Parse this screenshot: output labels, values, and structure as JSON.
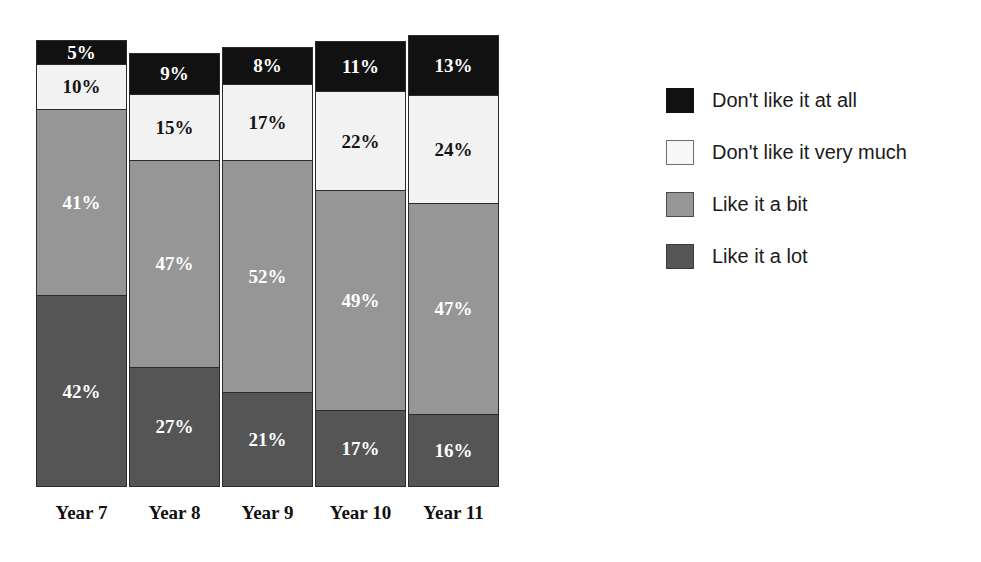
{
  "chart_data": {
    "type": "bar",
    "subtype": "100% stacked column",
    "title": "",
    "subtitle": "",
    "xlabel": "",
    "ylabel": "",
    "ylim": [
      0,
      100
    ],
    "grid": false,
    "legend_position": "right",
    "value_suffix": "%",
    "categories": [
      "Year 7",
      "Year 8",
      "Year 9",
      "Year 10",
      "Year 11"
    ],
    "series": [
      {
        "name": "Don't like it at all",
        "color": "#111111",
        "label_color": "#ffffff",
        "values": [
          5,
          9,
          8,
          11,
          13
        ],
        "labels": [
          "5%",
          "9%",
          "8%",
          "11%",
          "13%"
        ]
      },
      {
        "name": "Don't like it very much",
        "color": "#f2f2f2",
        "label_color": "#141414",
        "values": [
          10,
          15,
          17,
          22,
          24
        ],
        "labels": [
          "10%",
          "15%",
          "17%",
          "22%",
          "24%"
        ]
      },
      {
        "name": "Like it a bit",
        "color": "#969696",
        "label_color": "#ffffff",
        "values": [
          41,
          47,
          52,
          49,
          47
        ],
        "labels": [
          "41%",
          "47%",
          "52%",
          "49%",
          "47%"
        ]
      },
      {
        "name": "Like it a lot",
        "color": "#555555",
        "label_color": "#ffffff",
        "values": [
          42,
          27,
          21,
          17,
          16
        ],
        "labels": [
          "42%",
          "27%",
          "21%",
          "17%",
          "16%"
        ]
      }
    ]
  },
  "legend": {
    "items": [
      {
        "label": "Don't like it at all",
        "swatch": "dislike-all",
        "color": "#111111"
      },
      {
        "label": "Don't like it very much",
        "swatch": "dislike-much",
        "color": "#f7f7f7"
      },
      {
        "label": "Like it a bit",
        "swatch": "like-bit",
        "color": "#969696"
      },
      {
        "label": "Like it a lot",
        "swatch": "like-lot",
        "color": "#555555"
      }
    ]
  },
  "bars": [
    {
      "category": "Year 7",
      "left": 36,
      "height": 447,
      "segments": [
        {
          "key": "dislike-all",
          "label": "5%",
          "value": 5
        },
        {
          "key": "dislike-much",
          "label": "10%",
          "value": 10
        },
        {
          "key": "like-bit",
          "label": "41%",
          "value": 41
        },
        {
          "key": "like-lot",
          "label": "42%",
          "value": 42
        }
      ]
    },
    {
      "category": "Year 8",
      "left": 129,
      "height": 434,
      "segments": [
        {
          "key": "dislike-all",
          "label": "9%",
          "value": 9
        },
        {
          "key": "dislike-much",
          "label": "15%",
          "value": 15
        },
        {
          "key": "like-bit",
          "label": "47%",
          "value": 47
        },
        {
          "key": "like-lot",
          "label": "27%",
          "value": 27
        }
      ]
    },
    {
      "category": "Year 9",
      "left": 222,
      "height": 440,
      "segments": [
        {
          "key": "dislike-all",
          "label": "8%",
          "value": 8
        },
        {
          "key": "dislike-much",
          "label": "17%",
          "value": 17
        },
        {
          "key": "like-bit",
          "label": "52%",
          "value": 52
        },
        {
          "key": "like-lot",
          "label": "21%",
          "value": 21
        }
      ]
    },
    {
      "category": "Year 10",
      "left": 315,
      "height": 446,
      "segments": [
        {
          "key": "dislike-all",
          "label": "11%",
          "value": 11
        },
        {
          "key": "dislike-much",
          "label": "22%",
          "value": 22
        },
        {
          "key": "like-bit",
          "label": "49%",
          "value": 49
        },
        {
          "key": "like-lot",
          "label": "17%",
          "value": 17
        }
      ]
    },
    {
      "category": "Year 11",
      "left": 408,
      "height": 452,
      "segments": [
        {
          "key": "dislike-all",
          "label": "13%",
          "value": 13
        },
        {
          "key": "dislike-much",
          "label": "24%",
          "value": 24
        },
        {
          "key": "like-bit",
          "label": "47%",
          "value": 47
        },
        {
          "key": "like-lot",
          "label": "16%",
          "value": 16
        }
      ]
    }
  ]
}
